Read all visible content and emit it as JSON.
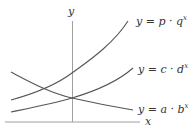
{
  "diagram": {
    "title": "",
    "axes": {
      "x_label": "x",
      "y_label": "y"
    },
    "curves": [
      {
        "id": "pq",
        "label_prefix": "y = p · q",
        "exponent": "x",
        "description": "steep increasing exponential"
      },
      {
        "id": "cd",
        "label_prefix": "y = c · d",
        "exponent": "x",
        "description": "gentle increasing exponential"
      },
      {
        "id": "ab",
        "label_prefix": "y = a · b",
        "exponent": "x",
        "description": "decreasing exponential"
      }
    ],
    "colors": {
      "axis": "#9a9a9a",
      "curve": "#555555",
      "text": "#333333"
    }
  }
}
